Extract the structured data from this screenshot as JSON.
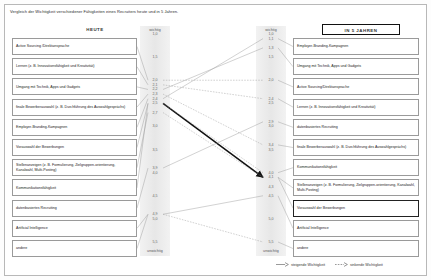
{
  "title": "Vergleich der Wichtigkeit verschiedener Fähigkeiten eines Recruiters heute und in 5 Jahren.",
  "columns": {
    "left_header": "HEUTE",
    "right_header": "IN 5 JAHREN"
  },
  "axis": {
    "top_label": "wichtig",
    "bottom_label": "unwichtig",
    "left_ticks": [
      "1,0",
      "1,5",
      "2,0",
      "2,1",
      "2,2",
      "2,3",
      "2,4",
      "2,5",
      "2,7",
      "3,0",
      "3,5",
      "3,9",
      "4,0",
      "4,5",
      "4,9",
      "5,0",
      "5,5"
    ],
    "right_ticks": [
      "1,0",
      "1,1",
      "1,3",
      "1,5",
      "2,0",
      "2,4",
      "2,5",
      "2,9",
      "3,0",
      "3,4",
      "3,5",
      "4,0",
      "4,1",
      "4,3",
      "4,5",
      "5,0",
      "5,5"
    ]
  },
  "left_items": [
    {
      "label": "Active Sourcing /Direktansprache",
      "value": 2.0
    },
    {
      "label": "Lernen (z. B. Innovationsfähigkeit und Kreativität)",
      "value": 2.1
    },
    {
      "label": "Umgang mit Technik, Apps und Gadgets",
      "value": 2.2
    },
    {
      "label": "finale Bewerberauswahl (z. B. Durchführung des Auswahlgesprächs)",
      "value": 2.3
    },
    {
      "label": "Employer-Branding-Kampagnen",
      "value": 2.4
    },
    {
      "label": "Vorauswahl der Bewerbungen",
      "value": 2.5
    },
    {
      "label": "Stellenanzeigen (z. B. Formulierung, Zielgruppen-orientierung, Kanalwahl, Multi-Posting)",
      "value": 2.7
    },
    {
      "label": "Kommunikationsfähigkeit",
      "value": 2.5
    },
    {
      "label": "datenbasiertes Recruiting",
      "value": 3.9
    },
    {
      "label": "Artificial Intelligence",
      "value": 4.9
    },
    {
      "label": "andere",
      "value": 4.9
    }
  ],
  "right_items": [
    {
      "label": "Employer-Branding-Kampagnen",
      "value": 1.1
    },
    {
      "label": "Umgang mit Technik, Apps und Gadgets",
      "value": 1.3
    },
    {
      "label": "Active Sourcing/Direktansprache",
      "value": 2.0
    },
    {
      "label": "Lernen (z. B. Innovationsfähigkeit und Kreativität)",
      "value": 2.4
    },
    {
      "label": "datenbasiertes Recruiting",
      "value": 2.9
    },
    {
      "label": "finale Bewerberauswahl (z. B. Durchführung des Auswahlgesprächs)",
      "value": 3.4
    },
    {
      "label": "Kommunikationsfähigkeit",
      "value": 4.0
    },
    {
      "label": "Stellenanzeigen (z. B. Formulierung, Zielgruppen-orientierung, Kanalwahl, Multi-Posting)",
      "value": 4.1
    },
    {
      "label": "Vorauswahl der Bewerbungen",
      "value": 4.1,
      "highlight": true
    },
    {
      "label": "Artificial Intelligence",
      "value": 4.5
    },
    {
      "label": "andere",
      "value": 5.5
    }
  ],
  "legend": [
    {
      "label": "steigende Wichtigkeit",
      "style": "solid"
    },
    {
      "label": "sinkende Wichtigkeit",
      "style": "dashed"
    }
  ],
  "chart_data": {
    "type": "line",
    "title": "Vergleich der Wichtigkeit verschiedener Fähigkeiten eines Recruiters heute und in 5 Jahren.",
    "xlabel": "",
    "ylabel": "Wichtigkeit",
    "categories": [
      "HEUTE",
      "IN 5 JAHREN"
    ],
    "ylim": [
      1.0,
      5.5
    ],
    "y_inverted": true,
    "grid": false,
    "legend_position": "bottom-right",
    "series": [
      {
        "name": "Active Sourcing /Direktansprache",
        "values": [
          2.0,
          2.0
        ],
        "trend": "gleich"
      },
      {
        "name": "Lernen (z. B. Innovationsfähigkeit und Kreativität)",
        "values": [
          2.1,
          2.4
        ],
        "trend": "sinkend"
      },
      {
        "name": "Umgang mit Technik, Apps und Gadgets",
        "values": [
          2.2,
          1.3
        ],
        "trend": "steigend"
      },
      {
        "name": "finale Bewerberauswahl (z. B. Durchführung des Auswahlgesprächs)",
        "values": [
          2.3,
          3.4
        ],
        "trend": "sinkend"
      },
      {
        "name": "Employer-Branding-Kampagnen",
        "values": [
          2.4,
          1.1
        ],
        "trend": "steigend"
      },
      {
        "name": "Vorauswahl der Bewerbungen",
        "values": [
          2.5,
          4.1
        ],
        "trend": "sinkend"
      },
      {
        "name": "Stellenanzeigen (z. B. Formulierung, Zielgruppenorientierung, Kanalwahl, Multi-Posting)",
        "values": [
          2.7,
          4.1
        ],
        "trend": "sinkend"
      },
      {
        "name": "Kommunikationsfähigkeit",
        "values": [
          2.5,
          4.0
        ],
        "trend": "sinkend"
      },
      {
        "name": "datenbasiertes Recruiting",
        "values": [
          3.9,
          2.9
        ],
        "trend": "steigend"
      },
      {
        "name": "Artificial Intelligence",
        "values": [
          4.9,
          4.5
        ],
        "trend": "steigend"
      },
      {
        "name": "andere",
        "values": [
          4.9,
          5.5
        ],
        "trend": "sinkend"
      }
    ]
  }
}
